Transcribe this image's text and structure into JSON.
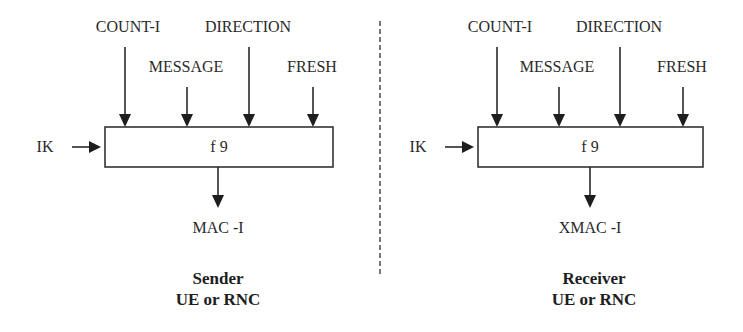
{
  "diagram": {
    "sender": {
      "inputs": {
        "count": "COUNT-I",
        "message": "MESSAGE",
        "direction": "DIRECTION",
        "fresh": "FRESH",
        "key": "IK"
      },
      "function": "f 9",
      "output": "MAC -I",
      "caption_line1": "Sender",
      "caption_line2": "UE or RNC"
    },
    "receiver": {
      "inputs": {
        "count": "COUNT-I",
        "message": "MESSAGE",
        "direction": "DIRECTION",
        "fresh": "FRESH",
        "key": "IK"
      },
      "function": "f 9",
      "output": "XMAC -I",
      "caption_line1": "Receiver",
      "caption_line2": "UE or RNC"
    },
    "colors": {
      "stroke": "#2a2a2a",
      "background": "#ffffff",
      "divider": "#555555"
    }
  }
}
